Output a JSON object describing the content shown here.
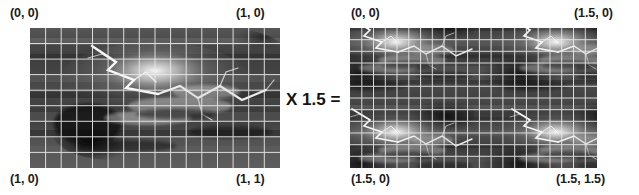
{
  "figure": {
    "background_color": "#ffffff",
    "text_color": "#1b1b1b",
    "grid_color": "#e8e8e8"
  },
  "operator": {
    "label": "X 1.5 =",
    "name": "multiply-by-1.5"
  },
  "panels": [
    {
      "id": "left",
      "name": "uv-panel-original",
      "scale": "1.0",
      "grid_cols": 16,
      "grid_rows": 9,
      "corners": {
        "top_left": "(0, 0)",
        "top_right": "(1, 0)",
        "bottom_left": "(1, 0)",
        "bottom_right": "(1, 1)"
      }
    },
    {
      "id": "right",
      "name": "uv-panel-scaled",
      "scale": "1.5",
      "grid_cols": 21,
      "grid_rows": 12,
      "corners": {
        "top_left": "(0, 0)",
        "top_right": "(1.5, 0)",
        "bottom_left": "(1.5, 0)",
        "bottom_right": "(1.5, 1.5)"
      }
    }
  ]
}
